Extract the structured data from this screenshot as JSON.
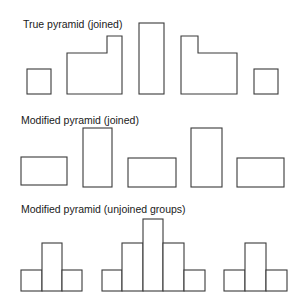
{
  "diagram": {
    "stroke_color": "#3a3a3a",
    "sections": [
      {
        "id": "true-pyramid-joined",
        "title": "True pyramid (joined)",
        "title_pos": [
          23,
          18
        ],
        "shapes": [
          {
            "type": "rect",
            "x": 27,
            "y": 69,
            "w": 24,
            "h": 25
          },
          {
            "type": "polygon",
            "points": "67,94 67,53 107,53 107,36 122,36 122,94"
          },
          {
            "type": "rect",
            "x": 139,
            "y": 23,
            "w": 25,
            "h": 71
          },
          {
            "type": "polygon",
            "points": "181,94 181,36 198,36 198,53 237,53 237,94"
          },
          {
            "type": "rect",
            "x": 254,
            "y": 69,
            "w": 24,
            "h": 25
          }
        ]
      },
      {
        "id": "modified-pyramid-joined",
        "title": "Modified pyramid (joined)",
        "title_pos": [
          21,
          114
        ],
        "shapes": [
          {
            "type": "rect",
            "x": 21,
            "y": 157,
            "w": 46,
            "h": 28
          },
          {
            "type": "rect",
            "x": 83,
            "y": 128,
            "w": 29,
            "h": 59
          },
          {
            "type": "rect",
            "x": 128,
            "y": 158,
            "w": 48,
            "h": 29
          },
          {
            "type": "rect",
            "x": 191,
            "y": 128,
            "w": 31,
            "h": 59
          },
          {
            "type": "rect",
            "x": 237,
            "y": 158,
            "w": 47,
            "h": 29
          }
        ]
      },
      {
        "id": "modified-pyramid-unjoined-groups",
        "title": "Modified pyramid (unjoined groups)",
        "title_pos": [
          21,
          203
        ],
        "shapes": [
          {
            "type": "rect",
            "x": 21,
            "y": 270,
            "w": 21,
            "h": 21
          },
          {
            "type": "rect",
            "x": 42,
            "y": 243,
            "w": 20,
            "h": 48
          },
          {
            "type": "rect",
            "x": 62,
            "y": 270,
            "w": 20,
            "h": 21
          },
          {
            "type": "rect",
            "x": 102,
            "y": 270,
            "w": 20,
            "h": 21
          },
          {
            "type": "rect",
            "x": 122,
            "y": 243,
            "w": 21,
            "h": 48
          },
          {
            "type": "rect",
            "x": 143,
            "y": 219,
            "w": 20,
            "h": 72
          },
          {
            "type": "rect",
            "x": 163,
            "y": 243,
            "w": 21,
            "h": 48
          },
          {
            "type": "rect",
            "x": 184,
            "y": 270,
            "w": 21,
            "h": 21
          },
          {
            "type": "rect",
            "x": 224,
            "y": 270,
            "w": 21,
            "h": 21
          },
          {
            "type": "rect",
            "x": 245,
            "y": 243,
            "w": 21,
            "h": 48
          },
          {
            "type": "rect",
            "x": 266,
            "y": 270,
            "w": 21,
            "h": 21
          }
        ]
      }
    ]
  }
}
